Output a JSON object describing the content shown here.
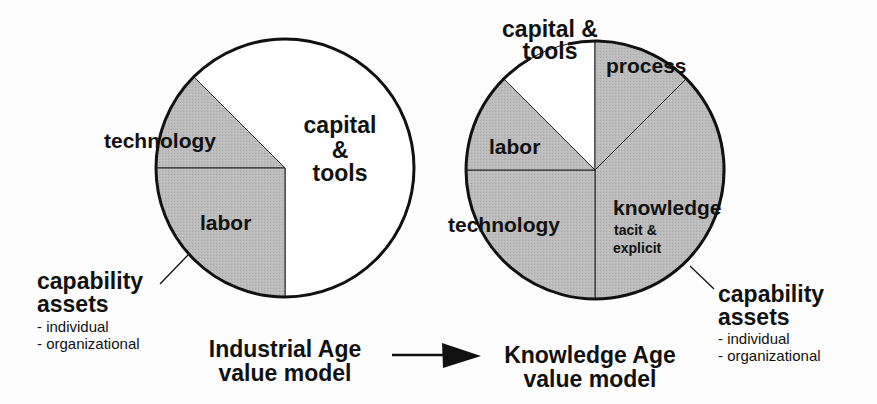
{
  "colors": {
    "shaded": "#b9b9b9",
    "unshaded": "#ffffff",
    "outline": "#111111",
    "background": "#fdfdfd"
  },
  "left_model": {
    "title_line1": "Industrial Age",
    "title_line2": "value model",
    "segments": [
      {
        "label": "capital",
        "label2": "&",
        "label3": "tools",
        "shaded": false,
        "angle_deg": 225
      },
      {
        "label": "technology",
        "shaded": true,
        "angle_deg": 45
      },
      {
        "label": "labor",
        "shaded": true,
        "angle_deg": 90
      }
    ],
    "callout": {
      "title_line1": "capability",
      "title_line2": "assets",
      "items": [
        "-  individual",
        "-  organizational"
      ]
    }
  },
  "right_model": {
    "title_line1": "Knowledge Age",
    "title_line2": "value model",
    "segments": [
      {
        "label": "capital &",
        "label2": "tools",
        "shaded": false,
        "angle_deg": 45
      },
      {
        "label": "process",
        "shaded": true,
        "angle_deg": 45
      },
      {
        "label": "knowledge",
        "sublabel1": "tacit &",
        "sublabel2": "explicit",
        "shaded": true,
        "angle_deg": 135
      },
      {
        "label": "technology",
        "shaded": true,
        "angle_deg": 90
      },
      {
        "label": "labor",
        "shaded": true,
        "angle_deg": 45
      }
    ],
    "callout": {
      "title_line1": "capability",
      "title_line2": "assets",
      "items": [
        "-  individual",
        "-  organizational"
      ]
    }
  },
  "transition_arrow": {
    "direction": "right",
    "meaning": "evolves to"
  }
}
